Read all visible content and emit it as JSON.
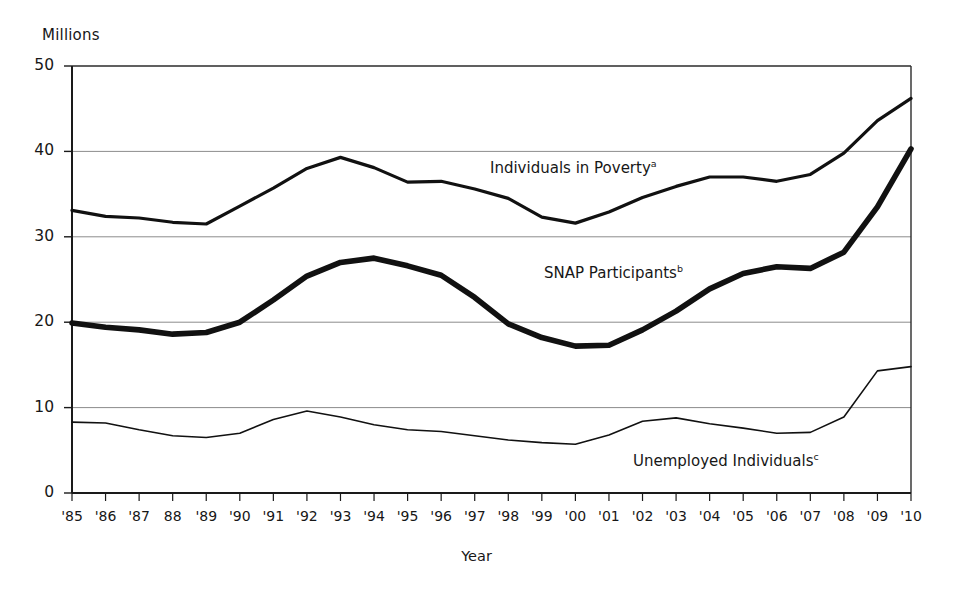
{
  "chart_data": {
    "type": "line",
    "title": "",
    "subtitle": "",
    "xlabel": "Year",
    "ylabel": "Millions",
    "ylim": [
      0,
      50
    ],
    "yticks": [
      0,
      10,
      20,
      30,
      40,
      50
    ],
    "ytick_labels": [
      "0",
      "10",
      "20",
      "30",
      "40",
      "50"
    ],
    "grid": "horizontal",
    "legend_position": "inline-annotation",
    "x": [
      1985,
      1986,
      1987,
      1988,
      1989,
      1990,
      1991,
      1992,
      1993,
      1994,
      1995,
      1996,
      1997,
      1998,
      1999,
      2000,
      2001,
      2002,
      2003,
      2004,
      2005,
      2006,
      2007,
      2008,
      2009,
      2010
    ],
    "xtick_labels": [
      "'85",
      "'86",
      "'87",
      "88",
      "'89",
      "'90",
      "'91",
      "'92",
      "'93",
      "'94",
      "'95",
      "'96",
      "'97",
      "'98",
      "'99",
      "'00",
      "'01",
      "'02",
      "'03",
      "'04",
      "'05",
      "'06",
      "'07",
      "'08",
      "'09",
      "'10"
    ],
    "series": [
      {
        "name": "Individuals in Poverty",
        "footnote": "a",
        "label_text": "Individuals in Poverty",
        "stroke_width": 3.2,
        "color": "#111111",
        "values": [
          33.1,
          32.4,
          32.2,
          31.7,
          31.5,
          33.6,
          35.7,
          38.0,
          39.3,
          38.1,
          36.4,
          36.5,
          35.6,
          34.5,
          32.3,
          31.6,
          32.9,
          34.6,
          35.9,
          37.0,
          37.0,
          36.5,
          37.3,
          39.8,
          43.6,
          46.2
        ]
      },
      {
        "name": "SNAP Participants",
        "footnote": "b",
        "label_text": "SNAP Participants",
        "stroke_width": 5.6,
        "color": "#111111",
        "values": [
          19.9,
          19.4,
          19.1,
          18.6,
          18.8,
          20.0,
          22.6,
          25.4,
          27.0,
          27.5,
          26.6,
          25.5,
          22.9,
          19.8,
          18.2,
          17.2,
          17.3,
          19.1,
          21.3,
          23.9,
          25.7,
          26.5,
          26.3,
          28.2,
          33.5,
          40.3
        ]
      },
      {
        "name": "Unemployed Individuals",
        "footnote": "c",
        "label_text": "Unemployed Individuals",
        "stroke_width": 1.6,
        "color": "#111111",
        "values": [
          8.3,
          8.2,
          7.4,
          6.7,
          6.5,
          7.0,
          8.6,
          9.6,
          8.9,
          8.0,
          7.4,
          7.2,
          6.7,
          6.2,
          5.9,
          5.7,
          6.8,
          8.4,
          8.8,
          8.1,
          7.6,
          7.0,
          7.1,
          8.9,
          14.3,
          14.8
        ]
      }
    ]
  },
  "annotations": [
    {
      "name": "poverty-series-label",
      "text": "Individuals in Poverty",
      "footnote": "a",
      "x": 490,
      "y": 159
    },
    {
      "name": "snap-series-label",
      "text": "SNAP Participants",
      "footnote": "b",
      "x": 544,
      "y": 264
    },
    {
      "name": "unemployed-series-label",
      "text": "Unemployed Individuals",
      "footnote": "c",
      "x": 633,
      "y": 452
    }
  ]
}
